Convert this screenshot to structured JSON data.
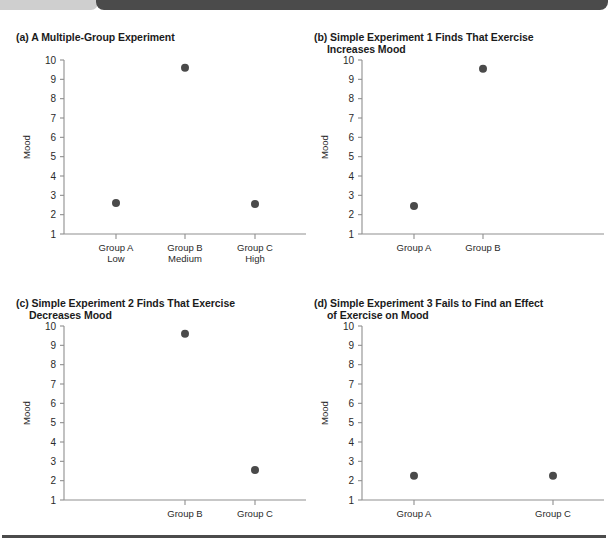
{
  "figure": {
    "panels": [
      {
        "key": "a",
        "title_line1": "(a) A Multiple-Group Experiment",
        "title_line2": ""
      },
      {
        "key": "b",
        "title_line1": "(b) Simple Experiment 1 Finds That Exercise",
        "title_line2": "Increases Mood"
      },
      {
        "key": "c",
        "title_line1": "(c) Simple Experiment 2 Finds That Exercise",
        "title_line2": "Decreases Mood"
      },
      {
        "key": "d",
        "title_line1": "(d) Simple Experiment 3 Fails to Find an Effect",
        "title_line2": "of Exercise on Mood"
      }
    ]
  },
  "chart_data": [
    {
      "type": "scatter",
      "panel": "a",
      "title": "(a) A Multiple-Group Experiment",
      "xlabel": "",
      "ylabel": "Mood",
      "ylim": [
        1,
        10
      ],
      "yticks": [
        1,
        2,
        3,
        4,
        5,
        6,
        7,
        8,
        9,
        10
      ],
      "ytick_labels": [
        "1",
        "2",
        "3",
        "4",
        "5",
        "6",
        "7",
        "8",
        "9",
        "10"
      ],
      "grid": false,
      "legend": "none",
      "marker_color": "#4a4a4a",
      "categories": [
        "Group A",
        "Group B",
        "Group C"
      ],
      "category_sublabels": [
        "Low",
        "Medium",
        "High"
      ],
      "slots": [
        1,
        2,
        3
      ],
      "values": [
        2.6,
        9.6,
        2.55
      ]
    },
    {
      "type": "scatter",
      "panel": "b",
      "title": "(b) Simple Experiment 1 Finds That Exercise Increases Mood",
      "xlabel": "",
      "ylabel": "Mood",
      "ylim": [
        1,
        10
      ],
      "yticks": [
        1,
        2,
        3,
        4,
        5,
        6,
        7,
        8,
        9,
        10
      ],
      "ytick_labels": [
        "1",
        "2",
        "3",
        "4",
        "5",
        "6",
        "7",
        "8",
        "9",
        "10"
      ],
      "grid": false,
      "legend": "none",
      "marker_color": "#4a4a4a",
      "categories": [
        "Group A",
        "Group B"
      ],
      "category_sublabels": [
        "",
        ""
      ],
      "slots": [
        1,
        2
      ],
      "values": [
        2.45,
        9.55
      ]
    },
    {
      "type": "scatter",
      "panel": "c",
      "title": "(c) Simple Experiment 2 Finds That Exercise Decreases Mood",
      "xlabel": "",
      "ylabel": "Mood",
      "ylim": [
        1,
        10
      ],
      "yticks": [
        1,
        2,
        3,
        4,
        5,
        6,
        7,
        8,
        9,
        10
      ],
      "ytick_labels": [
        "1",
        "2",
        "3",
        "4",
        "5",
        "6",
        "7",
        "8",
        "9",
        "10"
      ],
      "grid": false,
      "legend": "none",
      "marker_color": "#4a4a4a",
      "categories": [
        "Group B",
        "Group C"
      ],
      "category_sublabels": [
        "",
        ""
      ],
      "slots": [
        2,
        3
      ],
      "values": [
        9.6,
        2.55
      ]
    },
    {
      "type": "scatter",
      "panel": "d",
      "title": "(d) Simple Experiment 3 Fails to Find an Effect of Exercise on Mood",
      "xlabel": "",
      "ylabel": "Mood",
      "ylim": [
        1,
        10
      ],
      "yticks": [
        1,
        2,
        3,
        4,
        5,
        6,
        7,
        8,
        9,
        10
      ],
      "ytick_labels": [
        "1",
        "2",
        "3",
        "4",
        "5",
        "6",
        "7",
        "8",
        "9",
        "10"
      ],
      "grid": false,
      "legend": "none",
      "marker_color": "#4a4a4a",
      "categories": [
        "Group A",
        "Group C"
      ],
      "category_sublabels": [
        "",
        ""
      ],
      "slots": [
        1,
        3
      ],
      "values": [
        2.25,
        2.25
      ]
    }
  ]
}
